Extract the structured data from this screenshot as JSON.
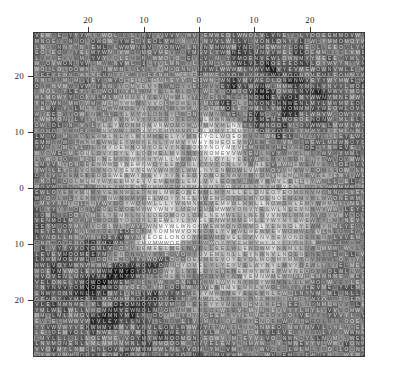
{
  "chart_data": {
    "type": "heatmap",
    "title": "",
    "subtitle": "",
    "xlabel": "",
    "ylabel": "",
    "grid": {
      "columns": 59,
      "rows": 58,
      "cell_width_px": 5.63,
      "cell_height_px": 5.6
    },
    "axes": {
      "x_axis": {
        "tick_labels": [
          "20",
          "10",
          "0",
          "10",
          "20"
        ],
        "tick_values": [
          -20,
          -10,
          0,
          10,
          20
        ],
        "tick_positions_px": [
          88,
          144,
          199,
          254,
          310
        ],
        "position": "top",
        "xlim": [
          -29.5,
          29.5
        ],
        "grid": true
      },
      "y_axis": {
        "tick_labels": [
          "20",
          "10",
          "0",
          "10",
          "20"
        ],
        "tick_values": [
          20,
          10,
          0,
          -10,
          -20
        ],
        "tick_positions_px": [
          76,
          132,
          188,
          244,
          300
        ],
        "position": "left",
        "ylim": [
          -29,
          29
        ],
        "grid": true
      }
    },
    "legend": {
      "visible": false,
      "entries": []
    },
    "glyphs": [
      "N",
      "O",
      "W",
      "E",
      "L",
      "Y",
      "V",
      "M"
    ],
    "colors": {
      "background": "#ffffff",
      "plot_background": "#e9e9e9",
      "frame": "#3a3a3a",
      "axis_line": "#3c3c3c",
      "grid_line": "#8d8d8d",
      "tick_label": "#2b2b2b",
      "glyph_dark": "#141414",
      "glyph_light": "#f2f2f2",
      "cell_shade_min": "#fafafa",
      "cell_shade_max": "#0d0d0d"
    },
    "value_range": [
      0,
      1
    ],
    "annotations": []
  },
  "figure": {
    "width": 393,
    "height": 383,
    "plot_area": {
      "left": 33,
      "top": 32,
      "width": 332,
      "height": 325
    }
  }
}
